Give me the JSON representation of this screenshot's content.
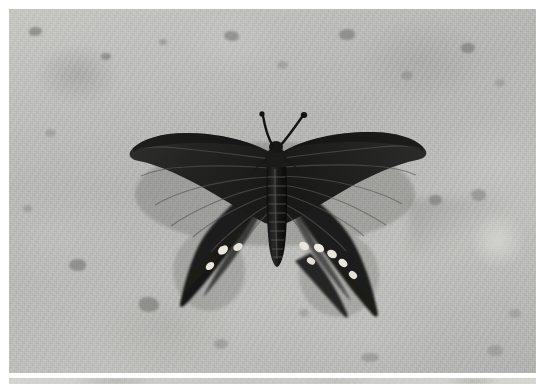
{
  "page": {
    "width": 544,
    "height": 384,
    "background_color": "#ffffff",
    "type": "photograph-viewer"
  },
  "main_photo": {
    "name": "butterfly-on-concrete",
    "alt_text": "Dark swallowtail butterfly with spread wings resting on speckled grey concrete",
    "color_mode": "grayscale",
    "x": 9,
    "y": 9,
    "width": 527,
    "height": 364,
    "background_color": "#b5b5b3",
    "subject": {
      "name": "swallowtail-butterfly",
      "wing_color": "#2b2b2b",
      "spot_color": "#ece9e0",
      "body_color": "#1d1d1d",
      "wingspan_px": 283,
      "left_wing_tip_x": 132,
      "right_wing_tip_x": 415,
      "left_tail_tip": "180,305",
      "right_tail_tip": "375,315",
      "antenna_count": 2,
      "hindwing_spot_count_left": 3,
      "hindwing_spot_count_right": 6
    },
    "surface": {
      "name": "concrete-gravel-ground",
      "base_color": "#b5b5b3",
      "light_patch_color": "#c9c9c6",
      "dark_pebble_color": "#767673",
      "light_circle": {
        "cx": 495,
        "cy": 240,
        "r": 26
      }
    }
  },
  "next_photo": {
    "name": "next-photo-strip",
    "alt_text": "Top edge of the following photograph, partially scrolled into view",
    "x": 9,
    "y": 378,
    "width": 527,
    "height": 6,
    "background_color": "#cfcfcd"
  },
  "caption_text": ""
}
